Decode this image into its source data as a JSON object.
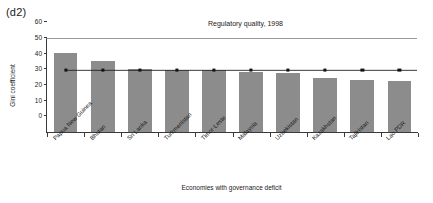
{
  "panel_label": "(d2)",
  "axis": {
    "y_label": "Gini coefficient",
    "x_label": "Economies with governance deficit",
    "y_ticks": [
      0,
      10,
      20,
      30,
      40,
      50,
      60
    ]
  },
  "colors": {
    "bar_fill": "#8c8c8c",
    "line": "#222222",
    "marker": "#111111",
    "axis": "#3a3a3a",
    "background": "#ffffff"
  },
  "chart_data": {
    "type": "bar",
    "title": "Regulatory quality, 1998",
    "xlabel": "Economies with governance deficit",
    "ylabel": "Gini coefficient",
    "ylim": [
      0,
      60
    ],
    "grid": false,
    "legend": "none",
    "categories": [
      "Papua New Guinea",
      "Bhutan",
      "Sri Lanka",
      "Turkmenistan",
      "Timor-Leste",
      "Malaysia",
      "Uzbekistan",
      "Kazakhstan",
      "Tajikistan",
      "Lao PDR"
    ],
    "series": [
      {
        "name": "Gini coefficient",
        "type": "bar",
        "values": [
          51,
          46,
          41,
          40,
          40,
          39,
          38,
          35,
          34,
          33
        ]
      },
      {
        "name": "Reference level",
        "type": "line",
        "values": [
          40,
          40,
          40,
          40,
          40,
          40,
          40,
          40,
          40,
          40
        ]
      }
    ]
  }
}
